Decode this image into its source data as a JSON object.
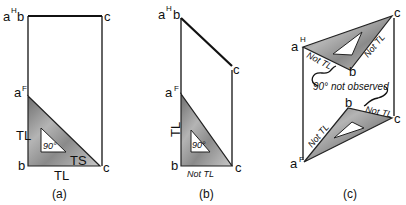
{
  "figure": {
    "panels": [
      {
        "id": "a",
        "caption": "(a)",
        "top_labels": {
          "a": "a",
          "sup": "H",
          "b": "b",
          "c": "c"
        },
        "front_labels": {
          "a": "a",
          "sup": "F",
          "b": "b",
          "c": "c"
        },
        "annotations": {
          "vertical_edge": "TL",
          "horizontal_edge": "TL",
          "hypotenuse": "TS",
          "angle": "90°"
        }
      },
      {
        "id": "b",
        "caption": "(b)",
        "top_labels": {
          "a": "a",
          "sup": "H",
          "b": "b",
          "c": "c"
        },
        "front_labels": {
          "a": "a",
          "sup": "F",
          "b": "b",
          "c": "c"
        },
        "annotations": {
          "vertical_edge": "TL",
          "horizontal_edge": "Not TL",
          "angle": "90°"
        }
      },
      {
        "id": "c",
        "caption": "(c)",
        "top_labels": {
          "a": "a",
          "sup": "H",
          "b": "b",
          "c": "c"
        },
        "front_labels": {
          "a": "a",
          "sup": "F",
          "b": "b",
          "c": "c"
        },
        "annotations": {
          "top_ab": "Not TL",
          "top_bc": "Not TL",
          "front_ab": "Not TL",
          "front_bc": "Not TL",
          "note": "90° not observed"
        }
      }
    ]
  }
}
